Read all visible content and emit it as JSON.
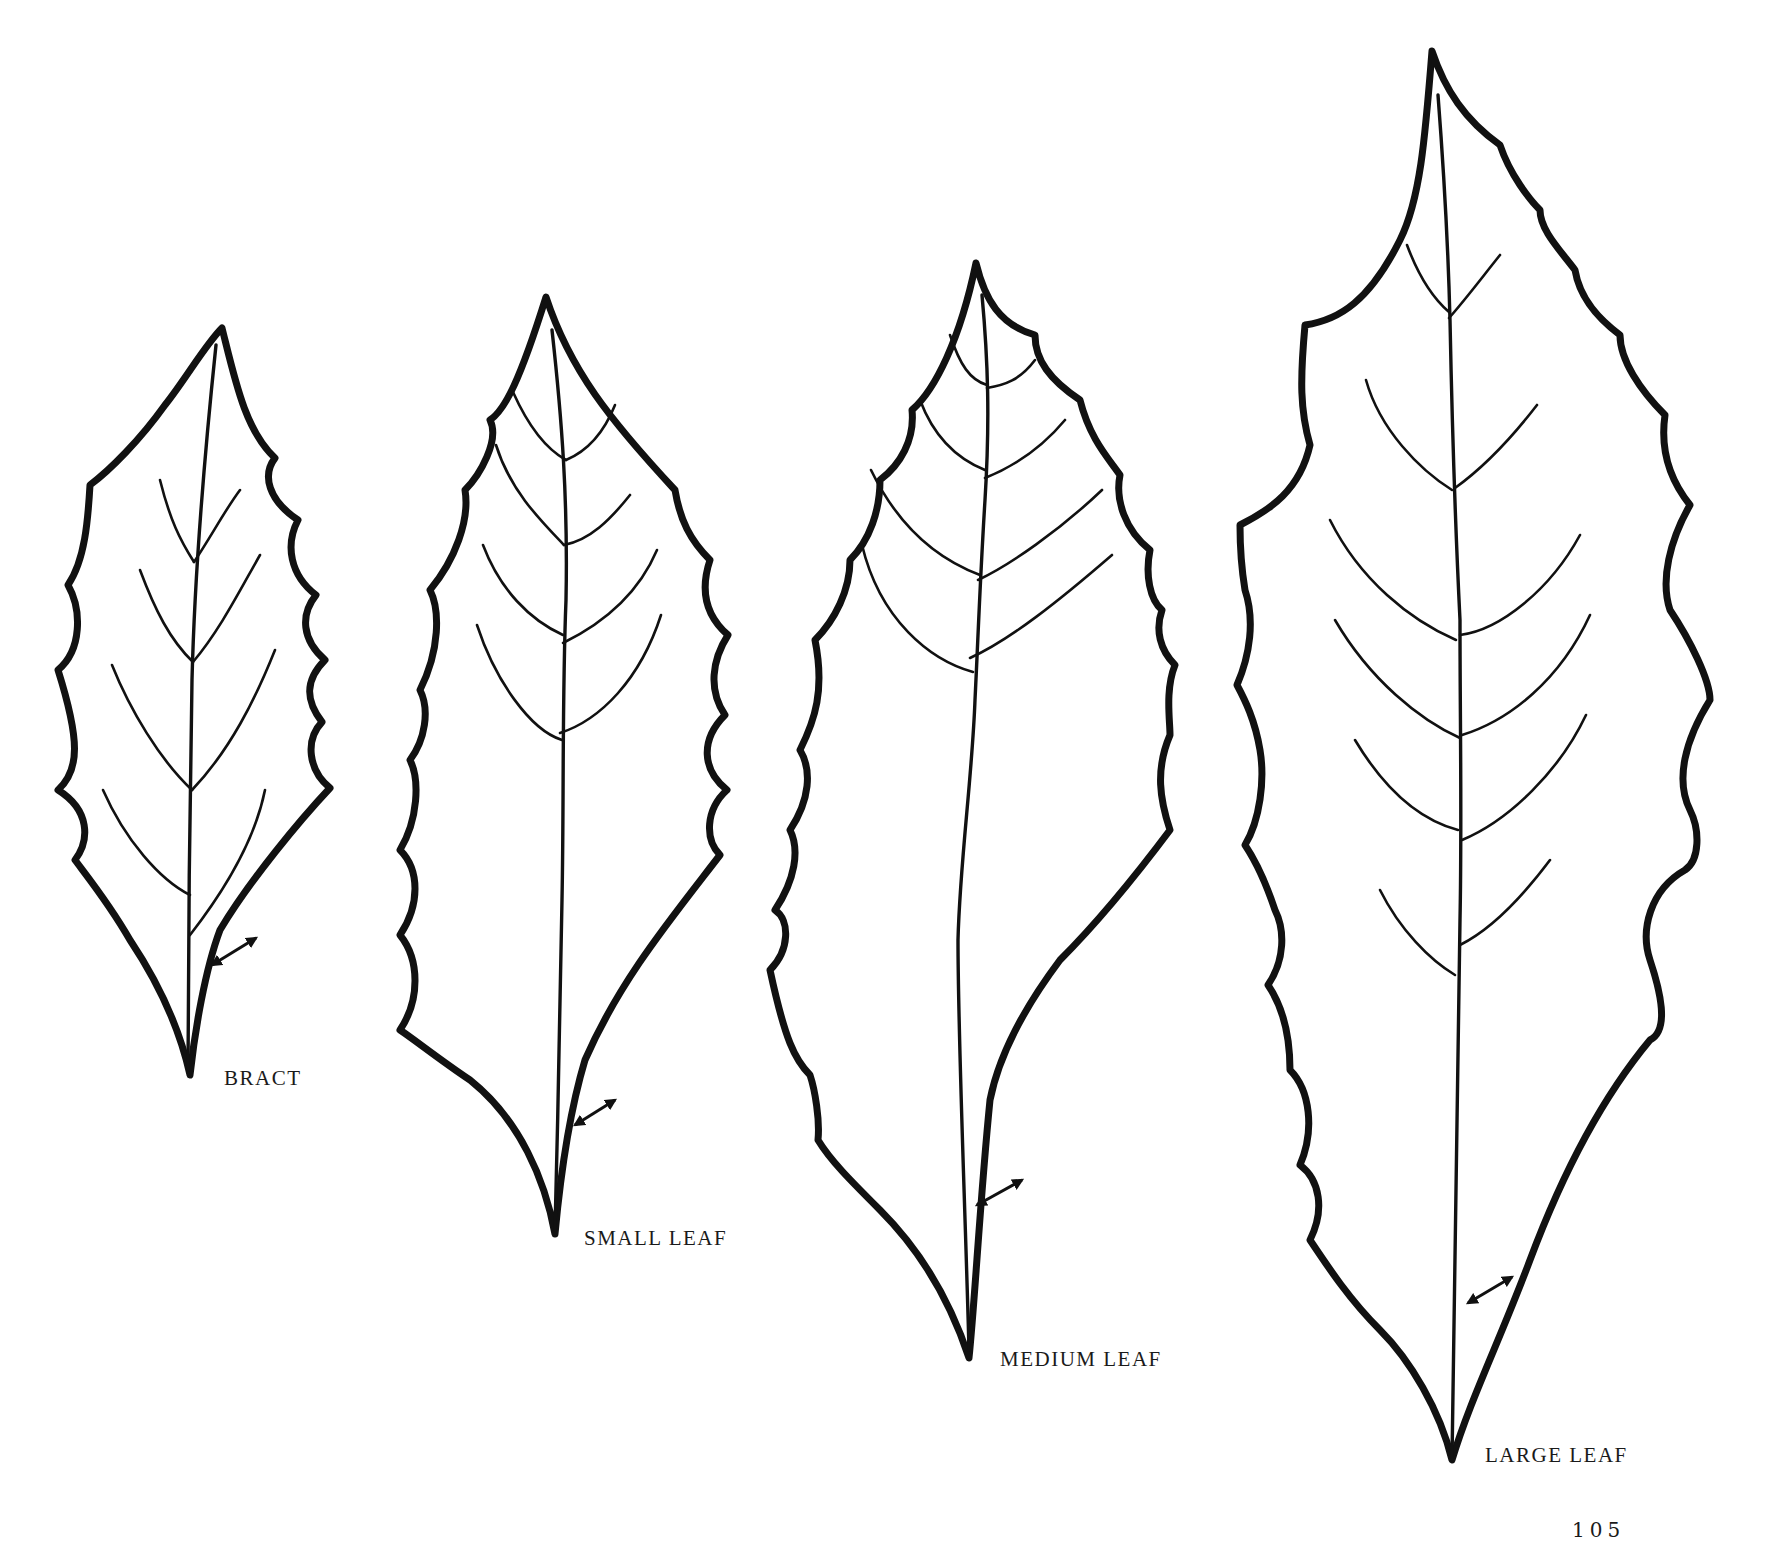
{
  "page": {
    "page_number": "105",
    "background": "#ffffff",
    "ink_color": "#111111"
  },
  "leaves": [
    {
      "id": "bract",
      "label": "BRACT"
    },
    {
      "id": "small",
      "label": "SMALL LEAF"
    },
    {
      "id": "medium",
      "label": "MEDIUM LEAF"
    },
    {
      "id": "large",
      "label": "LARGE LEAF"
    }
  ],
  "icons": {
    "grain_arrow": "double-headed arrow indicating grain direction"
  }
}
